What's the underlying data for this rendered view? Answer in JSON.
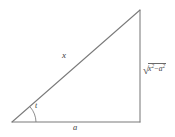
{
  "figure": {
    "type": "right-triangle-diagram",
    "background_color": "#ffffff",
    "stroke_color": "#7a7a7a",
    "text_color": "#3b3b3b",
    "vertices": {
      "left": [
        12,
        122
      ],
      "apex": [
        140,
        10
      ],
      "right_angle": [
        140,
        122
      ]
    },
    "labels": {
      "hypotenuse": "x",
      "angle": "t",
      "base": "a",
      "opposite_radicand_first": "x",
      "opposite_radicand_first_exp": "2",
      "opposite_operator": "−",
      "opposite_radicand_second": "a",
      "opposite_radicand_second_exp": "2",
      "opposite_radical_sign": "√"
    }
  }
}
